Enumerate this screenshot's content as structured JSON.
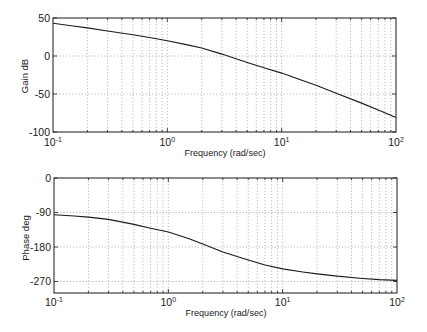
{
  "colors": {
    "background": "#ffffff",
    "curve": "#1a1a1a",
    "grid": "#8a8a8a"
  },
  "chart_data": [
    {
      "type": "line",
      "title": "",
      "xlabel": "Frequency (rad/sec)",
      "ylabel": "Gain dB",
      "xscale": "log",
      "xlim": [
        0.1,
        100
      ],
      "ylim": [
        -100,
        50
      ],
      "grid": true,
      "xticks": [
        0.1,
        1,
        10,
        100
      ],
      "xticklabels": [
        {
          "base": "10",
          "exp": "-1"
        },
        {
          "base": "10",
          "exp": "0"
        },
        {
          "base": "10",
          "exp": "1"
        },
        {
          "base": "10",
          "exp": "2"
        }
      ],
      "yticks": [
        50,
        0,
        -50,
        -100
      ],
      "yticklabels": [
        "50",
        "0",
        "-50",
        "-100"
      ],
      "x": [
        0.1,
        0.15,
        0.2,
        0.3,
        0.5,
        0.7,
        1,
        1.5,
        2,
        3,
        5,
        7,
        10,
        15,
        20,
        30,
        50,
        70,
        100
      ],
      "series": [
        {
          "name": "Gain",
          "values": [
            43,
            39.5,
            37,
            33,
            28,
            24.3,
            20,
            14.6,
            10.5,
            2.5,
            -8.5,
            -15.5,
            -22.5,
            -32,
            -38.5,
            -49,
            -62,
            -71,
            -81
          ]
        }
      ]
    },
    {
      "type": "line",
      "title": "",
      "xlabel": "Frequency (rad/sec)",
      "ylabel": "Phase deg",
      "xscale": "log",
      "xlim": [
        0.1,
        100
      ],
      "ylim": [
        -300,
        0
      ],
      "grid": true,
      "xticks": [
        0.1,
        1,
        10,
        100
      ],
      "xticklabels": [
        {
          "base": "10",
          "exp": "-1"
        },
        {
          "base": "10",
          "exp": "0"
        },
        {
          "base": "10",
          "exp": "1"
        },
        {
          "base": "10",
          "exp": "2"
        }
      ],
      "yticks": [
        0,
        -90,
        -180,
        -270
      ],
      "yticklabels": [
        "0",
        "-90",
        "-180",
        "-270"
      ],
      "x": [
        0.1,
        0.15,
        0.2,
        0.3,
        0.5,
        0.7,
        1,
        1.5,
        2,
        3,
        5,
        7,
        10,
        15,
        20,
        30,
        50,
        70,
        100
      ],
      "series": [
        {
          "name": "Phase",
          "values": [
            -96,
            -99,
            -102,
            -108,
            -121,
            -131,
            -141,
            -158,
            -172,
            -193,
            -214,
            -227,
            -237,
            -245,
            -250,
            -256,
            -262,
            -265,
            -267
          ]
        }
      ]
    }
  ]
}
